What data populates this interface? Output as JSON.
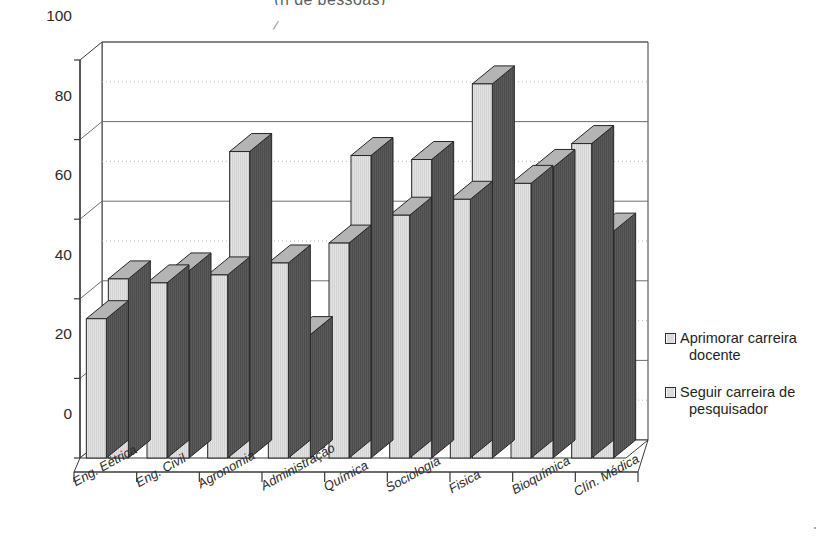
{
  "chart_data": {
    "type": "bar",
    "title": "(n de pessoas)",
    "xlabel": "",
    "ylabel": "",
    "ylim": [
      0,
      100
    ],
    "yticks": [
      0,
      20,
      40,
      60,
      80,
      100
    ],
    "grid": "horizontal-major-and-dotted-minor",
    "legend_position": "right",
    "style": "3d-clustered-column",
    "categories": [
      "Eng. Eétrica",
      "Eng. Civil",
      "Agronomia",
      "Administração",
      "Química",
      "Sociologia",
      "Fisica",
      "Bioquímica",
      "Clín. Médica"
    ],
    "series": [
      {
        "name": "Aprimorar carreira docente",
        "values": [
          35,
          44,
          46,
          49,
          54,
          61,
          65,
          69,
          79
        ]
      },
      {
        "name": "Seguir carreira de pesquisador",
        "values": [
          45,
          47,
          77,
          31,
          76,
          75,
          94,
          73,
          57
        ]
      }
    ],
    "colors": {
      "bar_front": "#e3e3e3",
      "bar_side": "#5a5a5a",
      "bar_top": "#b4b4b4",
      "bar_outline": "#262626",
      "axis": "#3a3a3a",
      "gridline_major": "#6e6e6e",
      "gridline_minor": "#b9b9b9",
      "text": "#1f1f1f",
      "background": "#ffffff"
    }
  },
  "legend": {
    "items": [
      {
        "label_line1": "Aprimorar carreira",
        "label_line2": "docente"
      },
      {
        "label_line1": "Seguir carreira de",
        "label_line2": "pesquisador"
      }
    ]
  }
}
